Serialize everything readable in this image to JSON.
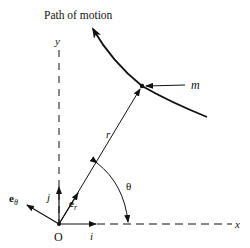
{
  "diagram": {
    "title": "Path of motion",
    "labels": {
      "y_axis": "y",
      "x_axis": "x",
      "origin": "O",
      "mass": "m",
      "radius": "r",
      "angle": "θ",
      "unit_i": "i",
      "unit_j": "j",
      "unit_er_base": "e",
      "unit_er_sub": "r",
      "unit_etheta_base": "e",
      "unit_etheta_sub": "θ"
    },
    "elements": [
      "x-axis (dashed)",
      "y-axis (dashed)",
      "curved path of motion with arrow",
      "particle m on path",
      "position vector r from O to m",
      "unit vectors i, j, e_r, e_theta at origin",
      "angle theta arc between x-axis and r"
    ],
    "colors": {
      "ink": "#111111",
      "background": "#ffffff"
    }
  }
}
